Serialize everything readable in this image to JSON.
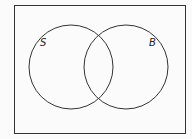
{
  "diagram": {
    "type": "venn",
    "sets": [
      {
        "label": "S"
      },
      {
        "label": "B"
      }
    ]
  },
  "colors": {
    "stroke": "#333333",
    "background": "#fbfbfb"
  }
}
